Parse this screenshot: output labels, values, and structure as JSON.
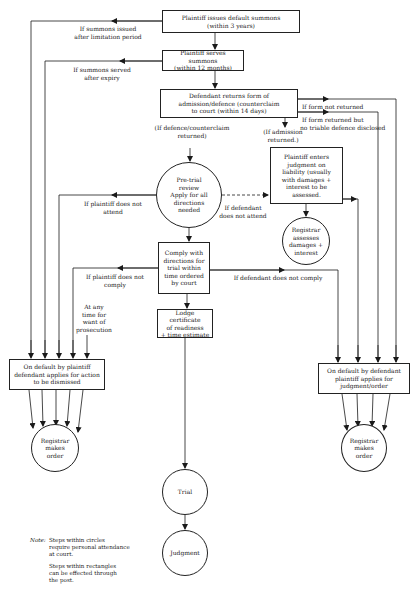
{
  "diagram": {
    "nodes": {
      "issue_summons": {
        "shape": "rectangle",
        "line1": "Plaintiff issues default summons",
        "line2": "(within 3 years)"
      },
      "serve_summons": {
        "shape": "rectangle",
        "line1": "Plaintiff serves summons",
        "line2": "(within 12 months)"
      },
      "defendant_returns": {
        "shape": "rectangle",
        "line1": "Defendant returns form of",
        "line2": "admission/defence (counterclaim",
        "line3": "to court (within 14 days)"
      },
      "pretrial_review": {
        "shape": "circle",
        "line1": "Pre-trial",
        "line2": "review",
        "line3": "Apply for all",
        "line4": "directions",
        "line5": "needed"
      },
      "enter_judgment": {
        "shape": "rectangle",
        "line1": "Plaintiff enters",
        "line2": "judgment on",
        "line3": "liability (usually",
        "line4": "with damages +",
        "line5": "interest to be",
        "line6": "assessed."
      },
      "registrar_assesses": {
        "shape": "circle",
        "line1": "Registrar",
        "line2": "assesses",
        "line3": "damages +",
        "line4": "interest"
      },
      "comply_directions": {
        "shape": "rectangle",
        "line1": "Comply with",
        "line2": "directions for",
        "line3": "trial within",
        "line4": "time ordered",
        "line5": "by court"
      },
      "lodge_certificate": {
        "shape": "rectangle",
        "line1": "Lodge certificate",
        "line2": "of readiness",
        "line3": "+ time estimate"
      },
      "default_plaintiff": {
        "shape": "rectangle",
        "line1": "On default by plaintiff",
        "line2": "defendant applies for action",
        "line3": "to be dismissed"
      },
      "registrar_order_left": {
        "shape": "circle",
        "line1": "Registrar",
        "line2": "makes",
        "line3": "order"
      },
      "default_defendant": {
        "shape": "rectangle",
        "line1": "On default by defendant",
        "line2": "plaintiff applies for",
        "line3": "judgment/order"
      },
      "registrar_order_right": {
        "shape": "circle",
        "line1": "Registrar",
        "line2": "makes",
        "line3": "order"
      },
      "trial": {
        "shape": "circle",
        "line1": "Trial"
      },
      "judgment": {
        "shape": "circle",
        "line1": "Judgment"
      }
    },
    "edge_labels": {
      "after_limitation": {
        "line1": "If summons issued",
        "line2": "after limitation period"
      },
      "served_after_expiry": {
        "line1": "If summons served",
        "line2": "after expiry"
      },
      "defence_returned": {
        "line1": "(If defence/counterclaim",
        "line2": "returned)"
      },
      "form_not_returned": {
        "line1": "If form not returned"
      },
      "no_triable_defence": {
        "line1": "If form returned but",
        "line2": "no triable defence disclosed"
      },
      "admission_returned": {
        "line1": "(If admission",
        "line2": "returned.)"
      },
      "plaintiff_not_attend": {
        "line1": "If plaintiff does not",
        "line2": "attend"
      },
      "defendant_not_attend": {
        "line1": "If defendant",
        "line2": "does not attend"
      },
      "plaintiff_not_comply": {
        "line1": "If plaintiff does not",
        "line2": "comply"
      },
      "defendant_not_comply": {
        "line1": "If defendant does not comply"
      },
      "want_of_prosecution": {
        "line1": "At any",
        "line2": "time for",
        "line3": "want of",
        "line4": "prosecution"
      }
    },
    "note": {
      "tag": "Note:",
      "para1_line1": "Steps within circles",
      "para1_line2": "require personal attendance",
      "para1_line3": "at court.",
      "para2_line1": "Steps within rectangles",
      "para2_line2": "can be effected through",
      "para2_line3": "the post."
    },
    "colors": {
      "ink": "#1a1a1a",
      "background": "#ffffff"
    }
  }
}
